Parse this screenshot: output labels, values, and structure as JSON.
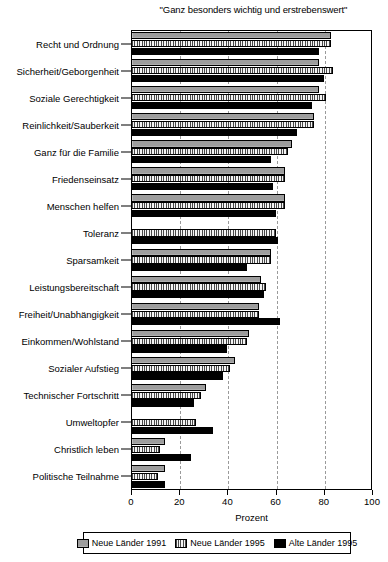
{
  "chart_data": {
    "type": "bar",
    "orientation": "horizontal",
    "title": "\"Ganz besonders wichtig und erstrebenswert\"",
    "xlabel": "Prozent",
    "ylabel": "",
    "xlim": [
      0,
      100
    ],
    "xticks": [
      0,
      20,
      40,
      60,
      80,
      100
    ],
    "grid": true,
    "grid_axis": "x",
    "legend_position": "bottom",
    "categories": [
      "Recht und Ordnung",
      "Sicherheit/Geborgenheit",
      "Soziale Gerechtigkeit",
      "Reinlichkeit/Sauberkeit",
      "Ganz für die Familie",
      "Friedenseinsatz",
      "Menschen helfen",
      "Toleranz",
      "Sparsamkeit",
      "Leistungsbereitschaft",
      "Freiheit/Unabhängigkeit",
      "Einkommen/Wohlstand",
      "Sozialer Aufstieg",
      "Technischer Fortschritt",
      "Umweltopfer",
      "Christlich leben",
      "Politische Teilnahme"
    ],
    "series": [
      {
        "name": "Neue Länder 1991",
        "color": "#9d9d9d",
        "values": [
          83,
          78,
          78,
          76,
          67,
          64,
          64,
          0,
          58,
          54,
          53,
          49,
          43,
          31,
          0,
          14,
          14
        ]
      },
      {
        "name": "Neue Länder 1995",
        "color": "#e8e8e8",
        "values": [
          83,
          84,
          81,
          76,
          65,
          64,
          64,
          60,
          58,
          56,
          53,
          48,
          41,
          29,
          27,
          12,
          11
        ]
      },
      {
        "name": "Alte Länder 1995",
        "color": "#000000",
        "values": [
          78,
          80,
          75,
          69,
          58,
          59,
          60,
          61,
          48,
          55,
          62,
          40,
          38,
          26,
          34,
          25,
          14
        ]
      }
    ]
  },
  "legend": {
    "items": [
      {
        "label": "Neue Länder 1991",
        "swatch": "swatch-neue-laender-1991"
      },
      {
        "label": "Neue Länder 1995",
        "swatch": "swatch-neue-laender-1995"
      },
      {
        "label": "Alte Länder 1995",
        "swatch": "swatch-alte-laender-1995"
      }
    ]
  }
}
